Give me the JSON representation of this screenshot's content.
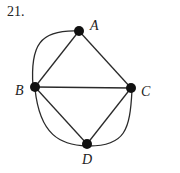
{
  "problem_number": "21.",
  "graph": {
    "nodes": [
      {
        "id": "A",
        "label": "A",
        "x": 79,
        "y": 31,
        "label_x": 90,
        "label_y": 30
      },
      {
        "id": "B",
        "label": "B",
        "x": 35,
        "y": 87,
        "label_x": 15,
        "label_y": 95
      },
      {
        "id": "C",
        "label": "C",
        "x": 131,
        "y": 88,
        "label_x": 141,
        "label_y": 96
      },
      {
        "id": "D",
        "label": "D",
        "x": 87,
        "y": 144,
        "label_x": 82,
        "label_y": 164
      }
    ],
    "edges": [
      {
        "from": "A",
        "to": "B",
        "type": "straight"
      },
      {
        "from": "A",
        "to": "B",
        "type": "curved"
      },
      {
        "from": "A",
        "to": "C",
        "type": "straight"
      },
      {
        "from": "B",
        "to": "C",
        "type": "straight"
      },
      {
        "from": "B",
        "to": "D",
        "type": "straight"
      },
      {
        "from": "B",
        "to": "D",
        "type": "curved"
      },
      {
        "from": "C",
        "to": "D",
        "type": "straight"
      },
      {
        "from": "C",
        "to": "D",
        "type": "curved"
      }
    ]
  }
}
